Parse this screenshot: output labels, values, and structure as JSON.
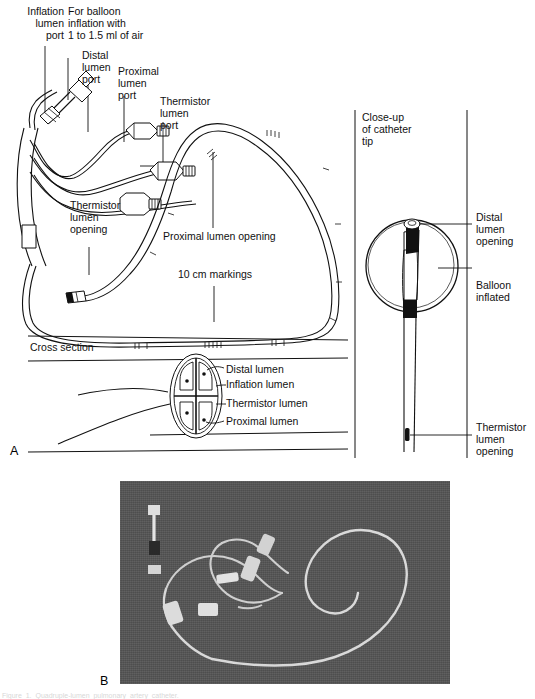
{
  "figure": {
    "panel_a_letter": "A",
    "panel_b_letter": "B",
    "cut_caption": "Figure  1.  Quadruple-lumen  pulmonary  artery  catheter."
  },
  "panel_a": {
    "labels": {
      "inflation_lumen_port": "Inflation\nlumen\nport",
      "balloon_note": "For balloon\ninflation with\n1 to 1.5 ml of air",
      "distal_lumen_port": "Distal\nlumen\nport",
      "proximal_lumen_port": "Proximal\nlumen\nport",
      "thermistor_lumen_port": "Thermistor\nlumen\nport",
      "thermistor_lumen_opening": "Thermistor\nlumen\nopening",
      "proximal_lumen_opening": "Proximal lumen opening",
      "ten_cm_markings": "10 cm markings",
      "cross_section": "Cross section"
    },
    "cross_section_labels": [
      "Distal lumen",
      "Inflation lumen",
      "Thermistor lumen",
      "Proximal lumen"
    ]
  },
  "panel_a_right": {
    "closeup_title": "Close-up\nof catheter\ntip",
    "labels": {
      "distal_lumen_opening": "Distal\nlumen\nopening",
      "balloon_inflated": "Balloon\ninflated",
      "thermistor_lumen_opening": "Thermistor\nlumen\nopening"
    }
  },
  "colors": {
    "ink": "#111111",
    "paper": "#ffffff",
    "photo_background": "#555555",
    "photo_catheter": "#d9d9d9"
  }
}
